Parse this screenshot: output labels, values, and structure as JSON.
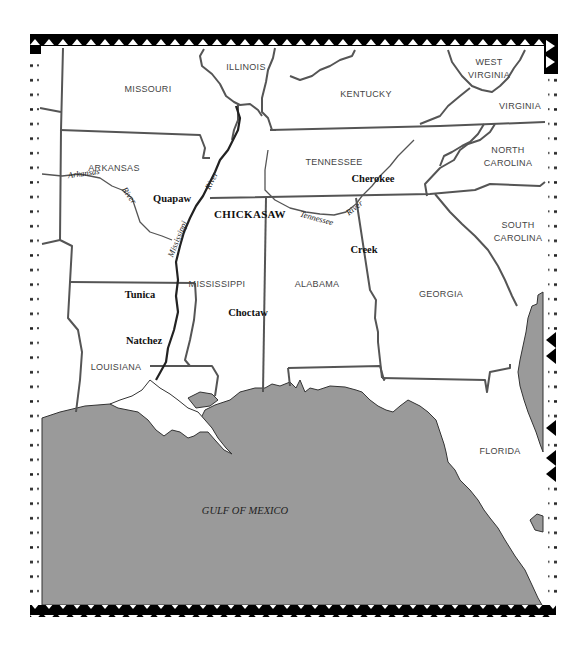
{
  "map": {
    "water_color": "#9a9a9a",
    "border_color": "#000000",
    "states": [
      {
        "name": "MISSOURI",
        "x": 148,
        "y": 92
      },
      {
        "name": "ILLINOIS",
        "x": 246,
        "y": 70
      },
      {
        "name": "KENTUCKY",
        "x": 366,
        "y": 97
      },
      {
        "name": "WEST",
        "x": 489,
        "y": 65
      },
      {
        "name": "VIRGINIA",
        "x": 489,
        "y": 78
      },
      {
        "name": "VIRGINIA",
        "x": 520,
        "y": 109
      },
      {
        "name": "ARKANSAS",
        "x": 114,
        "y": 171
      },
      {
        "name": "TENNESSEE",
        "x": 334,
        "y": 165
      },
      {
        "name": "NORTH",
        "x": 508,
        "y": 153
      },
      {
        "name": "CAROLINA",
        "x": 508,
        "y": 166
      },
      {
        "name": "SOUTH",
        "x": 518,
        "y": 228
      },
      {
        "name": "CAROLINA",
        "x": 518,
        "y": 241
      },
      {
        "name": "MISSISSIPPI",
        "x": 217,
        "y": 287
      },
      {
        "name": "ALABAMA",
        "x": 317,
        "y": 287
      },
      {
        "name": "GEORGIA",
        "x": 441,
        "y": 297
      },
      {
        "name": "LOUISIANA",
        "x": 116,
        "y": 370
      },
      {
        "name": "FLORIDA",
        "x": 500,
        "y": 454
      }
    ],
    "tribes": [
      {
        "name": "Quapaw",
        "x": 172,
        "y": 202
      },
      {
        "name": "CHICKASAW",
        "x": 250,
        "y": 218
      },
      {
        "name": "Cherokee",
        "x": 373,
        "y": 182
      },
      {
        "name": "Creek",
        "x": 364,
        "y": 253
      },
      {
        "name": "Tunica",
        "x": 140,
        "y": 298
      },
      {
        "name": "Choctaw",
        "x": 248,
        "y": 316
      },
      {
        "name": "Natchez",
        "x": 144,
        "y": 344
      }
    ],
    "rivers": [
      {
        "name": "Arkansas",
        "x": 84,
        "y": 176,
        "rotate": -8
      },
      {
        "name": "River",
        "x": 127,
        "y": 197,
        "rotate": 55
      },
      {
        "name": "River",
        "x": 214,
        "y": 182,
        "rotate": -62
      },
      {
        "name": "Mississippi",
        "x": 178,
        "y": 235,
        "rotate": -68
      },
      {
        "name": "Tennessee",
        "x": 316,
        "y": 221,
        "rotate": 15
      },
      {
        "name": "River",
        "x": 356,
        "y": 210,
        "rotate": -38
      }
    ],
    "water_bodies": [
      {
        "name": "GULF OF MEXICO",
        "x": 245,
        "y": 510
      }
    ]
  }
}
